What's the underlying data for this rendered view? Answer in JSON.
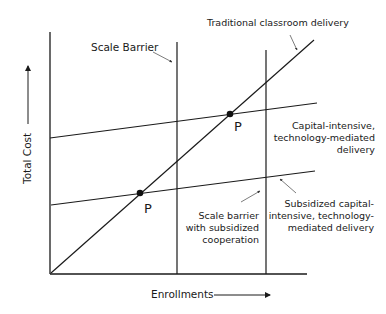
{
  "diagram": {
    "axes": {
      "x_label": "Enrollments",
      "y_label": "Total Cost"
    },
    "lines": {
      "traditional": "Traditional classroom delivery",
      "capital_intensive": [
        "Capital-intensive,",
        "technology-mediated",
        "delivery"
      ],
      "subsidized": [
        "Subsidized capital-",
        "intensive, technology-",
        "mediated delivery"
      ]
    },
    "barriers": {
      "scale_barrier": "Scale Barrier",
      "subsidized_barrier": [
        "Scale barrier",
        "with subsidized",
        "cooperation"
      ]
    },
    "points": {
      "upper": "P",
      "lower": "P"
    },
    "colors": {
      "line": "#1a1a1a",
      "background": "#ffffff"
    }
  }
}
